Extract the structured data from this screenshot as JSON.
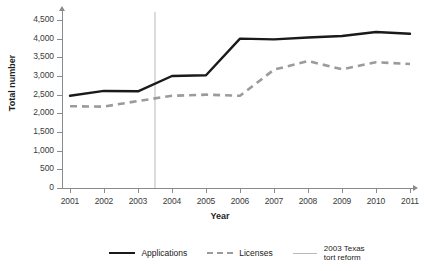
{
  "chart_data": {
    "type": "line",
    "title": "",
    "subtitle": "",
    "xlabel": "Year",
    "ylabel": "Total number",
    "x": [
      2001,
      2002,
      2003,
      2004,
      2005,
      2006,
      2007,
      2008,
      2009,
      2010,
      2011
    ],
    "categories": [
      "2001",
      "2002",
      "2003",
      "2004",
      "2005",
      "2006",
      "2007",
      "2008",
      "2009",
      "2010",
      "2011"
    ],
    "xlim": [
      2001,
      2011
    ],
    "ylim": [
      0,
      4500
    ],
    "ytick_values": [
      0,
      500,
      1000,
      1500,
      2000,
      2500,
      3000,
      3500,
      4000,
      4500
    ],
    "ytick_labels": [
      "0",
      "500",
      "1,000",
      "1,500",
      "2,000",
      "2,500",
      "3,000",
      "3,500",
      "4,000",
      "4,500"
    ],
    "grid": false,
    "legend_position": "bottom",
    "series": [
      {
        "name": "Applications",
        "style": "solid",
        "color": "#1a1a1a",
        "values": [
          2470,
          2600,
          2590,
          3000,
          3020,
          4000,
          3980,
          4030,
          4070,
          4180,
          4130
        ]
      },
      {
        "name": "Licenses",
        "style": "dashed",
        "color": "#9b9b9b",
        "values": [
          2190,
          2180,
          2330,
          2470,
          2500,
          2470,
          3170,
          3400,
          3180,
          3370,
          3320
        ]
      }
    ],
    "annotations": [
      {
        "name": "2003 Texas tort reform",
        "label": "2003 Texas\ntort reform",
        "type": "vertical-line",
        "x": 2003.5,
        "color": "#b9b9b9"
      }
    ]
  },
  "axes": {
    "y_title": "Total number",
    "x_title": "Year"
  },
  "legend": {
    "items": [
      {
        "label": "Applications",
        "style": "solid",
        "color": "#1a1a1a"
      },
      {
        "label": "Licenses",
        "style": "dashed",
        "color": "#9b9b9b"
      },
      {
        "label": "2003 Texas\ntort reform",
        "style": "thin",
        "color": "#b9b9b9"
      }
    ]
  },
  "colors": {
    "applications": "#1a1a1a",
    "licenses": "#9b9b9b",
    "reform_line": "#b9b9b9",
    "axis": "#8a8a8a",
    "background": "#ffffff",
    "text": "#2b2b2b"
  }
}
